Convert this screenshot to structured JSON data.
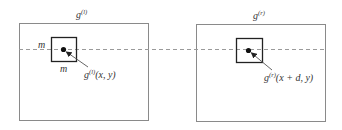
{
  "diagram": {
    "type": "stereo-correlation-window",
    "colors": {
      "outer_box": "#8a8a8a",
      "inner_box": "#222222",
      "dashed_line": "#9a9a9a",
      "dot": "#111111",
      "leader": "#555555"
    },
    "left_image": {
      "title_base": "g",
      "title_sup": "(l)",
      "window_size_label_side": "m",
      "window_size_label_bottom": "m",
      "point_label_base": "g",
      "point_label_sup": "(l)",
      "point_label_args": "(x, y)"
    },
    "right_image": {
      "title_base": "g",
      "title_sup": "(r)",
      "point_label_base": "g",
      "point_label_sup": "(r)",
      "point_label_args": "(x + d, y)"
    },
    "epipolar_line": "dashed horizontal line through both windows"
  }
}
